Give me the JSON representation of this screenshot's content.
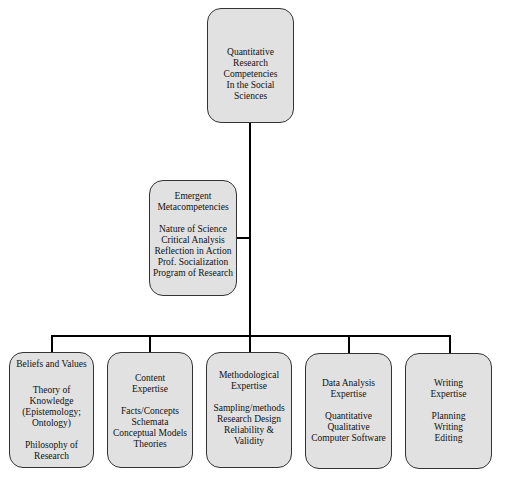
{
  "diagram": {
    "root": {
      "title_lines": [
        "Quantitative",
        "Research",
        "Competencies",
        "In the Social",
        "Sciences"
      ]
    },
    "meta": {
      "title_lines": [
        "Emergent",
        "Metacompetencies"
      ],
      "items": [
        "Nature of Science",
        "Critical Analysis",
        "Reflection in Action",
        "Prof. Socialization",
        "Program of Research"
      ]
    },
    "children": [
      {
        "title_lines": [
          "Beliefs and Values"
        ],
        "items": [
          "Theory of",
          "Knowledge",
          "(Epistemology;",
          "Ontology)"
        ],
        "items2": [
          "Philosophy of",
          "Research"
        ]
      },
      {
        "title_lines": [
          "Content",
          "Expertise"
        ],
        "items": [
          "Facts/Concepts",
          "Schemata",
          "Conceptual Models",
          "Theories"
        ]
      },
      {
        "title_lines": [
          "Methodological",
          "Expertise"
        ],
        "items": [
          "Sampling/methods",
          "Research Design",
          "Reliability &",
          "Validity"
        ]
      },
      {
        "title_lines": [
          "Data Analysis",
          "Expertise"
        ],
        "items": [
          "Quantitative",
          "Qualitative",
          "Computer Software"
        ]
      },
      {
        "title_lines": [
          "Writing",
          "Expertise"
        ],
        "items": [
          "Planning",
          "Writing",
          "Editing"
        ]
      }
    ]
  }
}
